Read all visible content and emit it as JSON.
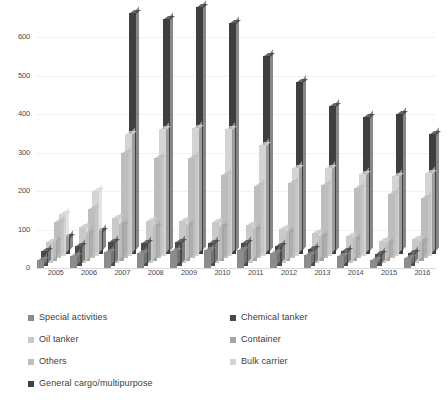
{
  "chart_data": {
    "type": "bar",
    "title": "",
    "subtitle": "",
    "xlabel": "",
    "ylabel": "",
    "grid": false,
    "legend_position": "bottom",
    "ylim": [
      0,
      650
    ],
    "yticks": [
      0,
      100,
      200,
      300,
      400,
      500,
      600
    ],
    "ytick_labels": [
      "0",
      "100",
      "200",
      "300",
      "400",
      "500",
      "600"
    ],
    "categories": [
      "2005",
      "2006",
      "2007",
      "2008",
      "2009",
      "2010",
      "2011",
      "2012",
      "2013",
      "2014",
      "2015",
      "2016"
    ],
    "series": [
      {
        "name": "Special activities",
        "color": "#8c8c8c",
        "values": [
          20,
          32,
          42,
          40,
          45,
          48,
          46,
          40,
          34,
          30,
          22,
          25
        ]
      },
      {
        "name": "Chemical tanker",
        "color": "#4a4a4a",
        "values": [
          38,
          52,
          62,
          60,
          62,
          60,
          58,
          50,
          44,
          38,
          30,
          32
        ]
      },
      {
        "name": "Oil tanker",
        "color": "#c9c9c9",
        "values": [
          55,
          95,
          118,
          110,
          110,
          108,
          100,
          90,
          78,
          70,
          58,
          62
        ]
      },
      {
        "name": "Container",
        "color": "#a5a5a5",
        "values": [
          48,
          70,
          92,
          88,
          90,
          88,
          80,
          72,
          62,
          55,
          44,
          48
        ]
      },
      {
        "name": "Others",
        "color": "#bdbdbd",
        "values": [
          95,
          128,
          275,
          262,
          262,
          218,
          188,
          196,
          192,
          182,
          168,
          158
        ]
      },
      {
        "name": "Bulk carrier",
        "color": "#d4d4d4",
        "values": [
          108,
          168,
          318,
          330,
          332,
          330,
          288,
          228,
          230,
          212,
          208,
          216
        ]
      },
      {
        "name": "General cargo/multipurpose",
        "color": "#3f3f3f",
        "values": [
          42,
          58,
          625,
          610,
          640,
          600,
          515,
          445,
          385,
          355,
          362,
          312
        ]
      }
    ]
  },
  "yaxis": {
    "ticks": [
      "600",
      "500",
      "400",
      "300",
      "200",
      "100",
      "0"
    ]
  },
  "xaxis": {
    "labels": [
      "2005",
      "2006",
      "2007",
      "2008",
      "2009",
      "2010",
      "2011",
      "2012",
      "2013",
      "2014",
      "2015",
      "2016"
    ]
  },
  "legend": {
    "items": [
      {
        "label": "Special activities",
        "color": "#8c8c8c",
        "col": 0,
        "row": 0
      },
      {
        "label": "Chemical tanker",
        "color": "#4a4a4a",
        "col": 1,
        "row": 0
      },
      {
        "label": "Oil tanker",
        "color": "#c9c9c9",
        "col": 0,
        "row": 1
      },
      {
        "label": "Container",
        "color": "#a5a5a5",
        "col": 1,
        "row": 1
      },
      {
        "label": "Others",
        "color": "#bdbdbd",
        "col": 0,
        "row": 2
      },
      {
        "label": "Bulk carrier",
        "color": "#d4d4d4",
        "col": 1,
        "row": 2
      },
      {
        "label": "General cargo/multipurpose",
        "color": "#3f3f3f",
        "col": 0,
        "row": 3
      }
    ]
  }
}
